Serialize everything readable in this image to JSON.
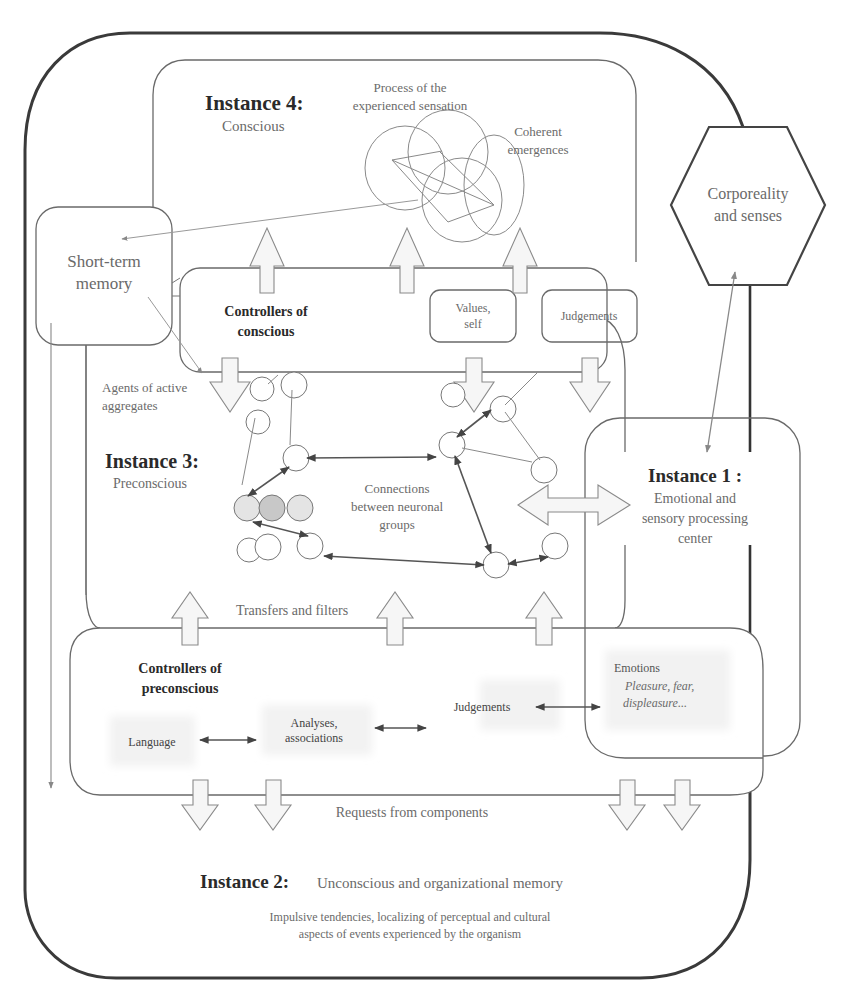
{
  "instance4": {
    "title": "Instance 4:",
    "subtitle": "Conscious",
    "process_label_line1": "Process of the",
    "process_label_line2": "experienced sensation",
    "coherent_line1": "Coherent",
    "coherent_line2": "emergences"
  },
  "corporeality": {
    "line1": "Corporeality",
    "line2": "and senses"
  },
  "short_term_memory": {
    "line1": "Short-term",
    "line2": "memory"
  },
  "controllers_conscious": {
    "title_line1": "Controllers of",
    "title_line2": "conscious",
    "values_line1": "Values,",
    "values_line2": "self",
    "judgements": "Judgements"
  },
  "agents": {
    "line1": "Agents of active",
    "line2": "aggregates"
  },
  "instance3": {
    "title": "Instance 3:",
    "subtitle": "Preconscious",
    "connections_line1": "Connections",
    "connections_line2": "between neuronal",
    "connections_line3": "groups",
    "transfers": "Transfers and filters"
  },
  "instance1": {
    "title": "Instance 1 :",
    "line1": "Emotional and",
    "line2": "sensory processing",
    "line3": "center"
  },
  "controllers_preconscious": {
    "title_line1": "Controllers of",
    "title_line2": "preconscious",
    "language": "Language",
    "analyses_line1": "Analyses,",
    "analyses_line2": "associations",
    "judgements": "Judgements",
    "emotions": "Emotions",
    "emotions_italic_line1": "Pleasure, fear,",
    "emotions_italic_line2": "displeasure..."
  },
  "requests": "Requests from components",
  "instance2": {
    "title": "Instance 2:",
    "subtitle": "Unconscious and organizational memory",
    "desc_line1": "Impulsive tendencies, localizing of perceptual and cultural",
    "desc_line2": "aspects of events experienced by the organism"
  }
}
